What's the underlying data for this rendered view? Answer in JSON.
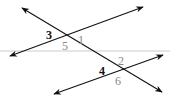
{
  "diagram": {
    "colors": {
      "line": "#111111",
      "reference_line": "#cccccc",
      "label_dark": "#111111",
      "label_gray": "#888888"
    },
    "lines": [
      {
        "id": "transversal",
        "x1": 22,
        "y1": 8,
        "x2": 162,
        "y2": 92
      },
      {
        "id": "parallel-upper",
        "x1": 10,
        "y1": 56,
        "x2": 143,
        "y2": 7
      },
      {
        "id": "parallel-lower",
        "x1": 54,
        "y1": 94,
        "x2": 163,
        "y2": 55
      }
    ],
    "reference_line": {
      "x1": 0,
      "y1": 51,
      "x2": 170,
      "y2": 51
    },
    "angle_labels": [
      {
        "text": "3",
        "x": 46,
        "y": 39,
        "tone": "dark"
      },
      {
        "text": "1",
        "x": 78,
        "y": 44,
        "tone": "gray"
      },
      {
        "text": "5",
        "x": 62,
        "y": 50,
        "tone": "gray"
      },
      {
        "text": "2",
        "x": 118,
        "y": 65,
        "tone": "gray"
      },
      {
        "text": "4",
        "x": 99,
        "y": 75,
        "tone": "dark"
      },
      {
        "text": "6",
        "x": 115,
        "y": 85,
        "tone": "gray"
      }
    ]
  }
}
